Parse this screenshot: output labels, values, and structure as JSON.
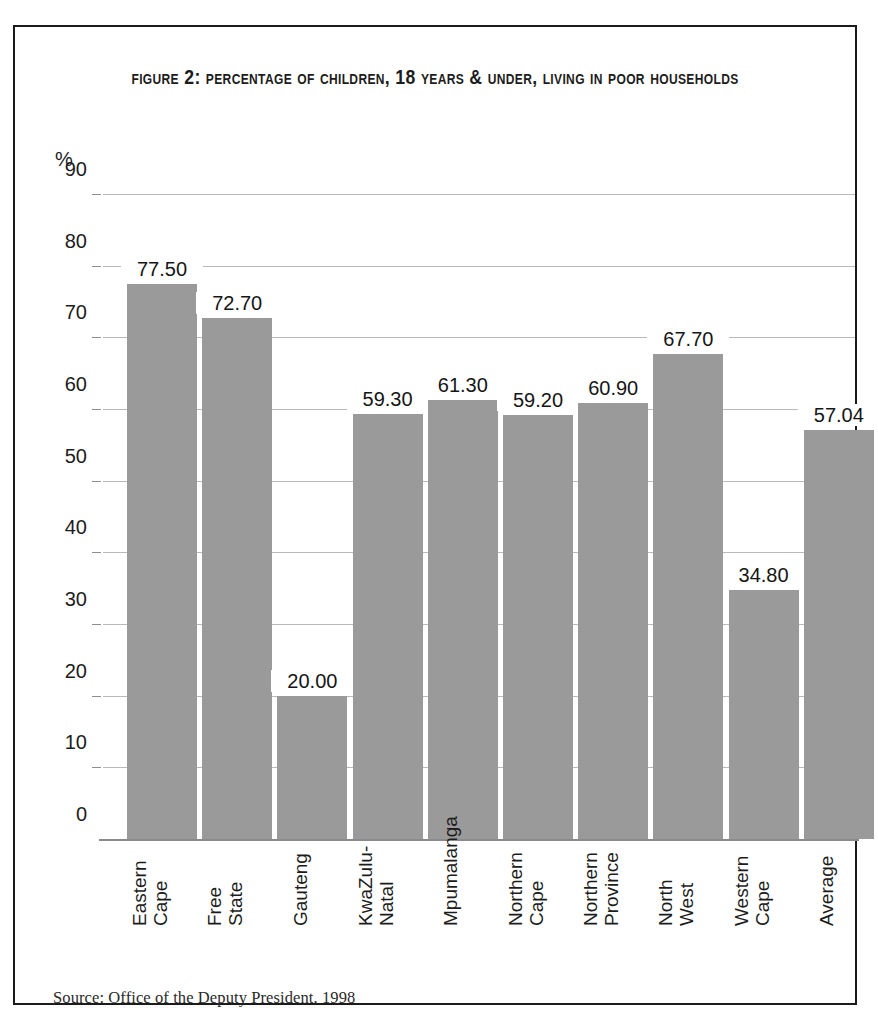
{
  "figure": {
    "title": "Figure 2: Percentage of children, 18 years & under, living in poor households",
    "source_note": "Source: Office of the Deputy President, 1998"
  },
  "chart_data": {
    "type": "bar",
    "title": "Figure 2: Percentage of children, 18 years & under, living in poor households",
    "xlabel": "",
    "ylabel": "%",
    "ylim": [
      0,
      90
    ],
    "yticks": [
      0,
      10,
      20,
      30,
      40,
      50,
      60,
      70,
      80,
      90
    ],
    "ytick_labels": [
      "0",
      "10",
      "20",
      "30",
      "40",
      "50",
      "60",
      "70",
      "80",
      "90"
    ],
    "grid": true,
    "legend": null,
    "bar_color": "#9a9a9a",
    "categories": [
      "Eastern Cape",
      "Free State",
      "Gauteng",
      "KwaZulu-Natal",
      "Mpumalanga",
      "Northern Cape",
      "Northern Province",
      "North West",
      "Western Cape",
      "Average"
    ],
    "category_lines": [
      [
        "Eastern",
        "Cape"
      ],
      [
        "Free",
        "State"
      ],
      [
        "Gauteng"
      ],
      [
        "KwaZulu-",
        "Natal"
      ],
      [
        "Mpumalanga"
      ],
      [
        "Northern",
        "Cape"
      ],
      [
        "Northern",
        "Province"
      ],
      [
        "North",
        "West"
      ],
      [
        "Western",
        "Cape"
      ],
      [
        "Average"
      ]
    ],
    "values": [
      77.5,
      72.7,
      20.0,
      59.3,
      61.3,
      59.2,
      60.9,
      67.7,
      34.8,
      57.04
    ],
    "value_labels": [
      "77.50",
      "72.70",
      "20.00",
      "59.30",
      "61.30",
      "59.20",
      "60.90",
      "67.70",
      "34.80",
      "57.04"
    ]
  }
}
